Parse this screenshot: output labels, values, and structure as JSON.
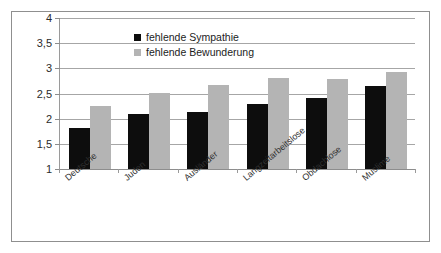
{
  "chart_data": {
    "type": "bar",
    "title": "",
    "xlabel": "",
    "ylabel": "",
    "categories": [
      "Deutsche",
      "Juden",
      "Ausländer",
      "Langzeitarbeitslose",
      "Obdachlose",
      "Muslime"
    ],
    "series": [
      {
        "name": "fehlende Sympathie",
        "color": "#0d0d0d",
        "values": [
          1.81,
          2.09,
          2.13,
          2.3,
          2.41,
          2.64
        ]
      },
      {
        "name": "fehlende Bewunderung",
        "color": "#b4b4b4",
        "values": [
          2.25,
          2.51,
          2.67,
          2.81,
          2.79,
          2.92
        ]
      }
    ],
    "ylim": [
      1,
      4
    ],
    "ytick_values": [
      1,
      1.5,
      2,
      2.5,
      3,
      3.5,
      4
    ],
    "ytick_labels": [
      "1",
      "1,5",
      "2",
      "2,5",
      "3",
      "3,5",
      "4"
    ],
    "grid": true,
    "legend_position": "top-center"
  }
}
